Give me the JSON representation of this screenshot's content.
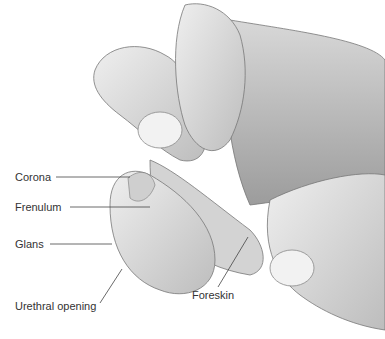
{
  "diagram": {
    "type": "anatomical-illustration",
    "labels": [
      {
        "id": "corona",
        "text": "Corona"
      },
      {
        "id": "frenulum",
        "text": "Frenulum"
      },
      {
        "id": "glans",
        "text": "Glans"
      },
      {
        "id": "urethral_opening",
        "text": "Urethral opening"
      },
      {
        "id": "foreskin",
        "text": "Foreskin"
      }
    ],
    "colors": {
      "label_text": "#333333",
      "leader_line": "#444444",
      "shading_light": "#e6e6e6",
      "shading_mid": "#c4c4c4",
      "shading_dark": "#8a8a8a"
    }
  }
}
